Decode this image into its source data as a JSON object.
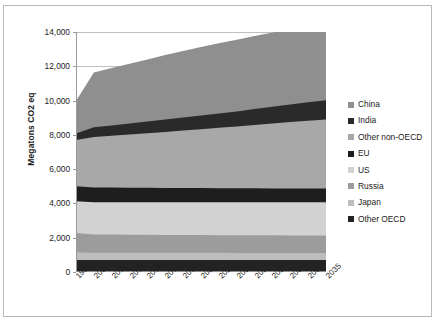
{
  "chart_data": {
    "type": "area",
    "title": "",
    "xlabel": "",
    "ylabel": "Megatons CO2 eq",
    "ylim": [
      0,
      14000
    ],
    "ytick_labels": [
      "14,000",
      "12,000",
      "10,000",
      "8,000",
      "6,000",
      "4,000",
      "2,000",
      "0"
    ],
    "ytick_values": [
      14000,
      12000,
      10000,
      8000,
      6000,
      4000,
      2000,
      0
    ],
    "grid": true,
    "stacked": true,
    "legend_position": "right",
    "categories": [
      "1990",
      "2009",
      "2011",
      "2013",
      "2015",
      "2017",
      "2019",
      "2021",
      "2023",
      "2025",
      "2027",
      "2029",
      "2031",
      "2033",
      "2035"
    ],
    "series": [
      {
        "name": "China",
        "color": "#8f8f8f",
        "values": [
          1900,
          3200,
          3340,
          3480,
          3620,
          3760,
          3880,
          3990,
          4090,
          4180,
          4260,
          4330,
          4400,
          4460,
          4520
        ]
      },
      {
        "name": "India",
        "color": "#2a2a2a",
        "values": [
          380,
          560,
          600,
          640,
          680,
          720,
          760,
          800,
          840,
          880,
          930,
          980,
          1030,
          1080,
          1130
        ]
      },
      {
        "name": "Other non-OECD",
        "color": "#a8a8a8",
        "values": [
          2700,
          2950,
          3030,
          3110,
          3190,
          3270,
          3360,
          3440,
          3520,
          3600,
          3690,
          3780,
          3870,
          3950,
          4030
        ]
      },
      {
        "name": "EU",
        "color": "#1e1e1e",
        "values": [
          880,
          860,
          855,
          850,
          845,
          840,
          835,
          830,
          825,
          820,
          815,
          810,
          805,
          800,
          795
        ]
      },
      {
        "name": "US",
        "color": "#d2d2d2",
        "values": [
          1850,
          1880,
          1885,
          1890,
          1895,
          1900,
          1905,
          1910,
          1915,
          1920,
          1925,
          1930,
          1935,
          1940,
          1945
        ]
      },
      {
        "name": "Russia",
        "color": "#9c9c9c",
        "values": [
          1120,
          1060,
          1055,
          1050,
          1045,
          1040,
          1038,
          1036,
          1034,
          1032,
          1030,
          1028,
          1026,
          1024,
          1022
        ]
      },
      {
        "name": "Japan",
        "color": "#bdbdbd",
        "values": [
          450,
          430,
          428,
          426,
          424,
          422,
          420,
          418,
          416,
          414,
          412,
          410,
          408,
          406,
          404
        ]
      },
      {
        "name": "Other OECD",
        "color": "#232323",
        "values": [
          700,
          700,
          700,
          700,
          700,
          700,
          700,
          700,
          700,
          700,
          700,
          700,
          700,
          700,
          700
        ]
      }
    ],
    "totals": [
      9980,
      11640,
      11893,
      12146,
      12399,
      12652,
      12894,
      13124,
      13344,
      13546,
      13762,
      13968,
      14174,
      14360,
      14546
    ]
  },
  "legend": {
    "items": [
      {
        "label": "China",
        "color": "#8f8f8f"
      },
      {
        "label": "India",
        "color": "#2a2a2a"
      },
      {
        "label": "Other non-OECD",
        "color": "#a8a8a8"
      },
      {
        "label": "EU",
        "color": "#1e1e1e"
      },
      {
        "label": "US",
        "color": "#d2d2d2"
      },
      {
        "label": "Russia",
        "color": "#9c9c9c"
      },
      {
        "label": "Japan",
        "color": "#bdbdbd"
      },
      {
        "label": "Other OECD",
        "color": "#232323"
      }
    ]
  }
}
